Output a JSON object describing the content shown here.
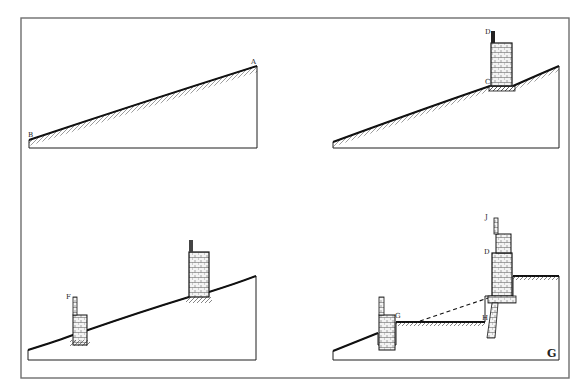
{
  "figure": {
    "frame_color": "#6e6e6e",
    "ink_color": "#1e1e1e",
    "background": "#ffffff",
    "corner_mark": "G"
  },
  "panels": [
    {
      "id": "top-left",
      "labels": [
        {
          "text": "A",
          "x": 251,
          "y": 64
        },
        {
          "text": "B",
          "x": 28,
          "y": 137
        }
      ]
    },
    {
      "id": "top-right",
      "labels": [
        {
          "text": "D",
          "x": 485,
          "y": 34
        },
        {
          "text": "C",
          "x": 485,
          "y": 84
        }
      ]
    },
    {
      "id": "bottom-left",
      "labels": [
        {
          "text": "F",
          "x": 66,
          "y": 299
        }
      ]
    },
    {
      "id": "bottom-right",
      "labels": [
        {
          "text": "J",
          "x": 485,
          "y": 219
        },
        {
          "text": "D",
          "x": 484,
          "y": 254
        },
        {
          "text": "G",
          "x": 395,
          "y": 318
        },
        {
          "text": "H",
          "x": 482,
          "y": 320
        }
      ]
    }
  ]
}
